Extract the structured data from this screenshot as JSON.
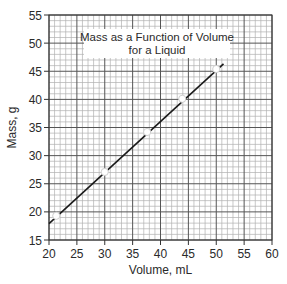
{
  "chart_data": {
    "type": "line",
    "title": "Mass as a Function of Volume for a Liquid",
    "title_lines": [
      "Mass as a Function of Volume",
      "for a Liquid"
    ],
    "xlabel": "Volume, mL",
    "ylabel": "Mass, g",
    "xlim": [
      20,
      60
    ],
    "ylim": [
      15,
      55
    ],
    "x_ticks": [
      20,
      25,
      30,
      35,
      40,
      45,
      50,
      55,
      60
    ],
    "y_ticks": [
      15,
      20,
      25,
      30,
      35,
      40,
      45,
      50,
      55
    ],
    "grid": {
      "on": true,
      "minor_step": 1,
      "major_step": 5
    },
    "legend": null,
    "series": [
      {
        "name": "measured points",
        "marker": "open-circle",
        "x": [
          21.3,
          30.0,
          37.6,
          43.9,
          50.0
        ],
        "y": [
          19.3,
          27.1,
          34.2,
          40.1,
          45.4
        ]
      },
      {
        "name": "best-fit line",
        "marker": "none",
        "x": [
          20.0,
          51.3
        ],
        "y": [
          17.9,
          46.3
        ]
      }
    ]
  },
  "style": {
    "line_color": "#1a1a1a",
    "minor_grid_color": "#b0b0b0",
    "major_grid_color": "#555555",
    "axis_color": "#333333",
    "marker_fill": "#ffffff",
    "marker_stroke": "#cfcfcf",
    "title_box_fill": "#ffffff"
  }
}
